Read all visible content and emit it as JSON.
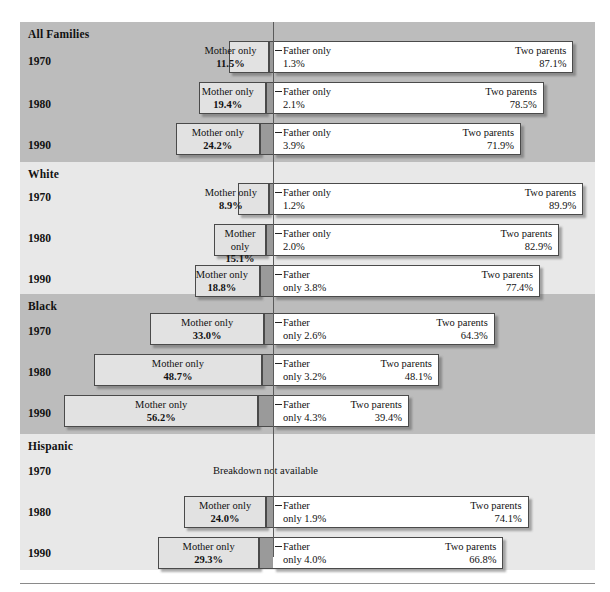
{
  "figure": {
    "axis_line_x": 273,
    "px_per_percent": 3.45,
    "bar_height": 32,
    "segment_labels": {
      "mother": "Mother only",
      "mother_wrapped": "Mother\nonly",
      "father": "Father only",
      "father_wrapped": "Father\nonly",
      "two": "Two parents"
    },
    "unavailable_note": "Breakdown not available"
  },
  "chart_data": {
    "type": "bar",
    "title": "",
    "xlabel": "",
    "ylabel": "",
    "orientation": "horizontal-stacked-centered",
    "series": [
      {
        "name": "Mother only"
      },
      {
        "name": "Father only"
      },
      {
        "name": "Two parents"
      }
    ],
    "groups": [
      {
        "name": "All Families",
        "rows": [
          {
            "year": "1970",
            "mother": 11.5,
            "father": 1.3,
            "two": 87.1,
            "mother_label": "Mother only",
            "mother_pct": "11.5%",
            "father_label": "Father only",
            "father_pct": "1.3%",
            "two_label": "Two parents",
            "two_pct": "87.1%"
          },
          {
            "year": "1980",
            "mother": 19.4,
            "father": 2.1,
            "two": 78.5,
            "mother_label": "Mother only",
            "mother_pct": "19.4%",
            "father_label": "Father only",
            "father_pct": "2.1%",
            "two_label": "Two parents",
            "two_pct": "78.5%"
          },
          {
            "year": "1990",
            "mother": 24.2,
            "father": 3.9,
            "two": 71.9,
            "mother_label": "Mother only",
            "mother_pct": "24.2%",
            "father_label": "Father only",
            "father_pct": "3.9%",
            "two_label": "Two parents",
            "two_pct": "71.9%"
          }
        ]
      },
      {
        "name": "White",
        "rows": [
          {
            "year": "1970",
            "mother": 8.9,
            "father": 1.2,
            "two": 89.9,
            "mother_label": "Mother only",
            "mother_pct": "8.9%",
            "father_label": "Father only",
            "father_pct": "1.2%",
            "two_label": "Two parents",
            "two_pct": "89.9%"
          },
          {
            "year": "1980",
            "mother": 15.1,
            "father": 2.0,
            "two": 82.9,
            "mother_label": "Mother\nonly",
            "mother_pct": "15.1%",
            "father_label": "Father only",
            "father_pct": "2.0%",
            "two_label": "Two parents",
            "two_pct": "82.9%"
          },
          {
            "year": "1990",
            "mother": 18.8,
            "father": 3.8,
            "two": 77.4,
            "mother_label": "Mother only",
            "mother_pct": "18.8%",
            "father_label": "Father\nonly",
            "father_pct": "3.8%",
            "two_label": "Two parents",
            "two_pct": "77.4%"
          }
        ]
      },
      {
        "name": "Black",
        "rows": [
          {
            "year": "1970",
            "mother": 33.0,
            "father": 2.6,
            "two": 64.3,
            "mother_label": "Mother only",
            "mother_pct": "33.0%",
            "father_label": "Father\nonly",
            "father_pct": "2.6%",
            "two_label": "Two parents",
            "two_pct": "64.3%"
          },
          {
            "year": "1980",
            "mother": 48.7,
            "father": 3.2,
            "two": 48.1,
            "mother_label": "Mother only",
            "mother_pct": "48.7%",
            "father_label": "Father\nonly",
            "father_pct": "3.2%",
            "two_label": "Two parents",
            "two_pct": "48.1%"
          },
          {
            "year": "1990",
            "mother": 56.2,
            "father": 4.3,
            "two": 39.4,
            "mother_label": "Mother only",
            "mother_pct": "56.2%",
            "father_label": "Father\nonly",
            "father_pct": "4.3%",
            "two_label": "Two parents",
            "two_pct": "39.4%"
          }
        ]
      },
      {
        "name": "Hispanic",
        "rows": [
          {
            "year": "1970",
            "unavailable": true,
            "note": "Breakdown not available"
          },
          {
            "year": "1980",
            "mother": 24.0,
            "father": 1.9,
            "two": 74.1,
            "mother_label": "Mother only",
            "mother_pct": "24.0%",
            "father_label": "Father\nonly",
            "father_pct": "1.9%",
            "two_label": "Two parents",
            "two_pct": "74.1%"
          },
          {
            "year": "1990",
            "mother": 29.3,
            "father": 4.0,
            "two": 66.8,
            "mother_label": "Mother only",
            "mother_pct": "29.3%",
            "father_label": "Father\nonly",
            "father_pct": "4.0%",
            "two_label": "Two parents",
            "two_pct": "66.8%"
          }
        ]
      }
    ],
    "colors": {
      "mother_fill": "#e2e2e2",
      "father_fill": "#9a9a9a",
      "two_fill": "#ffffff",
      "band_dark": "#bcbcbc",
      "band_light": "#e8e8e8",
      "stroke": "#4a4a4a"
    }
  }
}
